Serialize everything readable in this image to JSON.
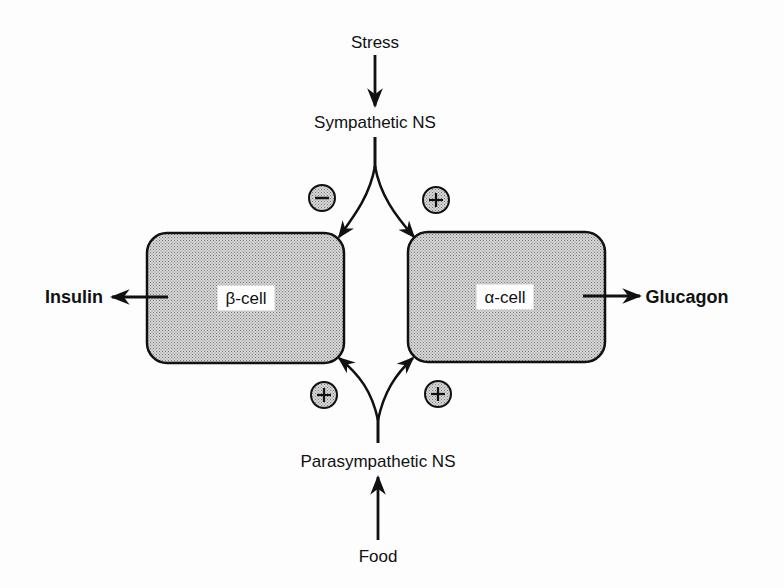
{
  "diagram": {
    "title": "",
    "nodes": {
      "stress": "Stress",
      "sympathetic": "Sympathetic NS",
      "beta_cell": "β-cell",
      "alpha_cell": "α-cell",
      "insulin": "Insulin",
      "glucagon": "Glucagon",
      "parasympathetic": "Parasympathetic NS",
      "food": "Food"
    },
    "signs": {
      "symp_to_beta": "−",
      "symp_to_alpha": "+",
      "parasymp_to_beta": "+",
      "parasymp_to_alpha": "+"
    },
    "edges": [
      {
        "from": "Stress",
        "to": "Sympathetic NS"
      },
      {
        "from": "Sympathetic NS",
        "to": "β-cell",
        "effect": "inhibit (−)"
      },
      {
        "from": "Sympathetic NS",
        "to": "α-cell",
        "effect": "stimulate (+)"
      },
      {
        "from": "Food",
        "to": "Parasympathetic NS"
      },
      {
        "from": "Parasympathetic NS",
        "to": "β-cell",
        "effect": "stimulate (+)"
      },
      {
        "from": "Parasympathetic NS",
        "to": "α-cell",
        "effect": "stimulate (+)"
      },
      {
        "from": "β-cell",
        "to": "Insulin"
      },
      {
        "from": "α-cell",
        "to": "Glucagon"
      }
    ],
    "colors": {
      "line": "#111111",
      "cell_fill": "#c4c4c4",
      "sign_fill": "#cfcfcf"
    }
  }
}
